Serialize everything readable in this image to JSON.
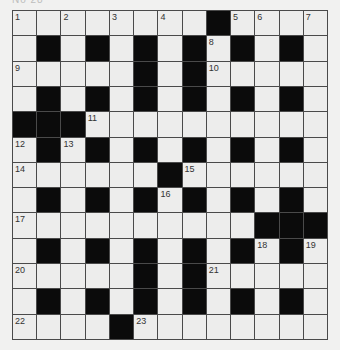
{
  "header": {
    "text": "No 28"
  },
  "puzzle": {
    "rows": 13,
    "cols": 13,
    "pattern": [
      "....#....#...",
      ".#.#.#.#.#.#.",
      ".....#.#.....",
      ".#.#.#.#.#.#.",
      "###..........",
      ".#.#.#.#.#.#.",
      "......#......",
      ".#.#.#.#.#.#.",
      "..........###",
      ".#.#.#.#.#.#.",
      ".....#.#.....",
      ".#.#.#.#.#.#.",
      "....#........"
    ],
    "numbers": [
      {
        "row": 0,
        "col": 0,
        "n": "1"
      },
      {
        "row": 0,
        "col": 2,
        "n": "2"
      },
      {
        "row": 0,
        "col": 4,
        "n": "3"
      },
      {
        "row": 0,
        "col": 6,
        "n": "4"
      },
      {
        "row": 0,
        "col": 9,
        "n": "5"
      },
      {
        "row": 0,
        "col": 10,
        "n": "6"
      },
      {
        "row": 0,
        "col": 12,
        "n": "7"
      },
      {
        "row": 1,
        "col": 8,
        "n": "8"
      },
      {
        "row": 2,
        "col": 0,
        "n": "9"
      },
      {
        "row": 2,
        "col": 8,
        "n": "10"
      },
      {
        "row": 4,
        "col": 3,
        "n": "11"
      },
      {
        "row": 5,
        "col": 0,
        "n": "12"
      },
      {
        "row": 5,
        "col": 2,
        "n": "13"
      },
      {
        "row": 6,
        "col": 0,
        "n": "14"
      },
      {
        "row": 6,
        "col": 7,
        "n": "15"
      },
      {
        "row": 7,
        "col": 6,
        "n": "16"
      },
      {
        "row": 8,
        "col": 0,
        "n": "17"
      },
      {
        "row": 9,
        "col": 10,
        "n": "18"
      },
      {
        "row": 9,
        "col": 12,
        "n": "19"
      },
      {
        "row": 10,
        "col": 0,
        "n": "20"
      },
      {
        "row": 10,
        "col": 8,
        "n": "21"
      },
      {
        "row": 12,
        "col": 0,
        "n": "22"
      },
      {
        "row": 12,
        "col": 5,
        "n": "23"
      }
    ]
  }
}
